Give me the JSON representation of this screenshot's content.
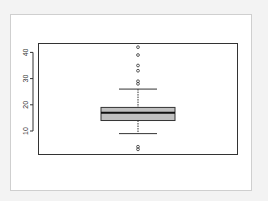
{
  "chart_data": {
    "type": "boxplot",
    "title": "",
    "xlabel": "",
    "ylabel": "",
    "yticks": [
      10,
      20,
      30,
      40
    ],
    "ylim": [
      1,
      44
    ],
    "grid": false,
    "legend": null,
    "box": {
      "whisker_low": 9,
      "q1": 14,
      "median": 17,
      "q3": 19,
      "whisker_high": 26,
      "fill": "#c0c0c0"
    },
    "outliers": [
      42,
      39,
      35,
      33,
      29,
      28,
      4,
      3
    ]
  }
}
